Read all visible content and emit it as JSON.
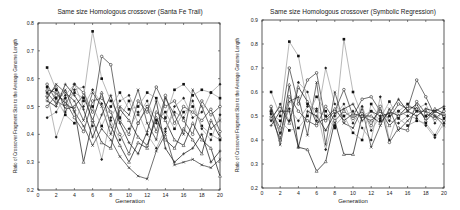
{
  "chart_data": [
    {
      "type": "line",
      "title": "Same size Homologous crossover (Santa Fe Trail)",
      "xlabel": "Generation",
      "ylabel": "Ratio of Crossover Fragment Size to the Average Genome Length",
      "xlim": [
        0,
        20
      ],
      "ylim": [
        0.2,
        0.8
      ],
      "xticks": [
        0,
        2,
        4,
        6,
        8,
        10,
        12,
        14,
        16,
        18,
        20
      ],
      "yticks": [
        0.2,
        0.3,
        0.4,
        0.5,
        0.6,
        0.7,
        0.8
      ],
      "grid": false,
      "x": [
        1,
        2,
        3,
        4,
        5,
        6,
        7,
        8,
        9,
        10,
        11,
        12,
        13,
        14,
        15,
        16,
        17,
        18,
        19,
        20
      ],
      "series": [
        {
          "name": "run1",
          "values": [
            0.64,
            0.56,
            0.53,
            0.55,
            0.53,
            0.77,
            0.6,
            0.52,
            0.46,
            0.52,
            0.44,
            0.5,
            0.45,
            0.48,
            0.42,
            0.48,
            0.5,
            0.43,
            0.4,
            0.38
          ]
        },
        {
          "name": "run2",
          "values": [
            0.58,
            0.52,
            0.5,
            0.58,
            0.55,
            0.48,
            0.68,
            0.65,
            0.45,
            0.4,
            0.52,
            0.48,
            0.57,
            0.5,
            0.52,
            0.45,
            0.4,
            0.52,
            0.47,
            0.5
          ]
        },
        {
          "name": "run3",
          "values": [
            0.56,
            0.55,
            0.51,
            0.49,
            0.3,
            0.45,
            0.55,
            0.43,
            0.36,
            0.3,
            0.37,
            0.35,
            0.48,
            0.45,
            0.38,
            0.36,
            0.44,
            0.38,
            0.35,
            0.25
          ]
        },
        {
          "name": "run4",
          "values": [
            0.55,
            0.39,
            0.48,
            0.56,
            0.57,
            0.43,
            0.31,
            0.46,
            0.52,
            0.54,
            0.47,
            0.52,
            0.44,
            0.41,
            0.5,
            0.53,
            0.46,
            0.48,
            0.55,
            0.58
          ]
        },
        {
          "name": "run5",
          "values": [
            0.53,
            0.58,
            0.55,
            0.52,
            0.45,
            0.55,
            0.5,
            0.4,
            0.5,
            0.47,
            0.56,
            0.44,
            0.38,
            0.53,
            0.47,
            0.4,
            0.56,
            0.5,
            0.42,
            0.45
          ]
        },
        {
          "name": "run6",
          "values": [
            0.52,
            0.5,
            0.58,
            0.54,
            0.49,
            0.39,
            0.47,
            0.54,
            0.44,
            0.37,
            0.33,
            0.41,
            0.52,
            0.35,
            0.3,
            0.33,
            0.35,
            0.4,
            0.3,
            0.34
          ]
        },
        {
          "name": "run7",
          "values": [
            0.57,
            0.53,
            0.47,
            0.44,
            0.52,
            0.5,
            0.43,
            0.5,
            0.55,
            0.49,
            0.5,
            0.55,
            0.53,
            0.46,
            0.56,
            0.58,
            0.54,
            0.56,
            0.55,
            0.53
          ]
        },
        {
          "name": "run8",
          "values": [
            0.5,
            0.54,
            0.52,
            0.46,
            0.41,
            0.52,
            0.53,
            0.48,
            0.4,
            0.33,
            0.44,
            0.5,
            0.41,
            0.54,
            0.44,
            0.5,
            0.48,
            0.45,
            0.49,
            0.41
          ]
        },
        {
          "name": "run9",
          "values": [
            0.54,
            0.57,
            0.49,
            0.5,
            0.54,
            0.45,
            0.37,
            0.35,
            0.49,
            0.45,
            0.39,
            0.36,
            0.46,
            0.38,
            0.35,
            0.42,
            0.38,
            0.33,
            0.45,
            0.39
          ]
        },
        {
          "name": "run10",
          "values": [
            0.46,
            0.48,
            0.54,
            0.58,
            0.5,
            0.56,
            0.51,
            0.45,
            0.38,
            0.42,
            0.48,
            0.4,
            0.35,
            0.42,
            0.48,
            0.46,
            0.52,
            0.42,
            0.38,
            0.47
          ]
        },
        {
          "name": "run11",
          "values": [
            0.55,
            0.51,
            0.56,
            0.48,
            0.43,
            0.36,
            0.42,
            0.38,
            0.32,
            0.28,
            0.25,
            0.24,
            0.34,
            0.4,
            0.29,
            0.3,
            0.31,
            0.29,
            0.28,
            0.31
          ]
        }
      ]
    },
    {
      "type": "line",
      "title": "Same size Homologous crossover (Symbolic Regression)",
      "xlabel": "Generation",
      "ylabel": "Ratio of Crossover Fragment Size to the Average Genome Length",
      "xlim": [
        0,
        20
      ],
      "ylim": [
        0.2,
        0.9
      ],
      "xticks": [
        0,
        2,
        4,
        6,
        8,
        10,
        12,
        14,
        16,
        18,
        20
      ],
      "yticks": [
        0.2,
        0.3,
        0.4,
        0.5,
        0.6,
        0.7,
        0.8,
        0.9
      ],
      "grid": false,
      "x": [
        1,
        2,
        3,
        4,
        5,
        6,
        7,
        8,
        9,
        10,
        11,
        12,
        13,
        14,
        15,
        16,
        17,
        18,
        19,
        20
      ],
      "series": [
        {
          "name": "run1",
          "values": [
            0.6,
            0.5,
            0.81,
            0.75,
            0.55,
            0.52,
            0.5,
            0.45,
            0.82,
            0.6,
            0.5,
            0.52,
            0.48,
            0.5,
            0.52,
            0.55,
            0.52,
            0.5,
            0.52,
            0.5
          ]
        },
        {
          "name": "run2",
          "values": [
            0.52,
            0.45,
            0.7,
            0.55,
            0.65,
            0.68,
            0.48,
            0.52,
            0.61,
            0.5,
            0.57,
            0.58,
            0.52,
            0.49,
            0.55,
            0.53,
            0.65,
            0.58,
            0.5,
            0.48
          ]
        },
        {
          "name": "run3",
          "values": [
            0.5,
            0.4,
            0.63,
            0.37,
            0.36,
            0.27,
            0.31,
            0.48,
            0.34,
            0.34,
            0.5,
            0.48,
            0.52,
            0.46,
            0.5,
            0.52,
            0.55,
            0.48,
            0.52,
            0.5
          ]
        },
        {
          "name": "run4",
          "values": [
            0.48,
            0.55,
            0.48,
            0.64,
            0.6,
            0.48,
            0.7,
            0.55,
            0.5,
            0.52,
            0.45,
            0.4,
            0.58,
            0.4,
            0.52,
            0.5,
            0.53,
            0.55,
            0.47,
            0.53
          ]
        },
        {
          "name": "run5",
          "values": [
            0.53,
            0.38,
            0.56,
            0.58,
            0.42,
            0.64,
            0.38,
            0.6,
            0.47,
            0.45,
            0.53,
            0.37,
            0.46,
            0.53,
            0.44,
            0.48,
            0.52,
            0.52,
            0.5,
            0.46
          ]
        },
        {
          "name": "run6",
          "values": [
            0.46,
            0.52,
            0.52,
            0.37,
            0.52,
            0.5,
            0.44,
            0.51,
            0.53,
            0.55,
            0.48,
            0.52,
            0.5,
            0.51,
            0.57,
            0.52,
            0.5,
            0.53,
            0.52,
            0.54
          ]
        },
        {
          "name": "run7",
          "values": [
            0.51,
            0.48,
            0.44,
            0.45,
            0.5,
            0.58,
            0.52,
            0.46,
            0.5,
            0.43,
            0.4,
            0.55,
            0.49,
            0.56,
            0.49,
            0.46,
            0.48,
            0.47,
            0.42,
            0.49
          ]
        },
        {
          "name": "run8",
          "values": [
            0.54,
            0.42,
            0.58,
            0.52,
            0.48,
            0.46,
            0.54,
            0.48,
            0.52,
            0.49,
            0.52,
            0.46,
            0.54,
            0.39,
            0.45,
            0.44,
            0.56,
            0.51,
            0.49,
            0.52
          ]
        },
        {
          "name": "run9",
          "values": [
            0.49,
            0.54,
            0.47,
            0.62,
            0.56,
            0.47,
            0.49,
            0.53,
            0.48,
            0.51,
            0.5,
            0.5,
            0.47,
            0.52,
            0.5,
            0.54,
            0.53,
            0.49,
            0.53,
            0.51
          ]
        },
        {
          "name": "run10",
          "values": [
            0.52,
            0.43,
            0.53,
            0.48,
            0.54,
            0.53,
            0.36,
            0.5,
            0.55,
            0.47,
            0.54,
            0.44,
            0.5,
            0.48,
            0.47,
            0.5,
            0.49,
            0.46,
            0.41,
            0.47
          ]
        }
      ]
    }
  ],
  "charts": [
    {
      "title": "Same size Homologous crossover (Santa Fe Trail)",
      "xlabel": "Generation",
      "ylabel": "Ratio of Crossover Fragment Size to the Average Genome Length"
    },
    {
      "title": "Same size Homologous crossover (Symbolic Regression)",
      "xlabel": "Generation",
      "ylabel": "Ratio of Crossover Fragment Size to the Average Genome Length"
    }
  ]
}
